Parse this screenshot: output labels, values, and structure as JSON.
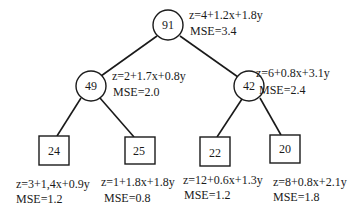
{
  "diagram": {
    "type": "model-tree",
    "nodes": [
      {
        "id": "root",
        "kind": "internal",
        "value": "91",
        "equation": "z=4+1.2x+1.8y",
        "mse": "MSE=3.4",
        "parent": null
      },
      {
        "id": "left",
        "kind": "internal",
        "value": "49",
        "equation": "z=2+1.7x+0.8y",
        "mse": "MSE=2.0",
        "parent": "root"
      },
      {
        "id": "right",
        "kind": "internal",
        "value": "42",
        "equation": "z=6+0.8x+3.1y",
        "mse": "MSE=2.4",
        "parent": "root"
      },
      {
        "id": "leaf1",
        "kind": "leaf",
        "value": "24",
        "equation": "z=3+1,4x+0.9y",
        "mse": "MSE=1.2",
        "parent": "left"
      },
      {
        "id": "leaf2",
        "kind": "leaf",
        "value": "25",
        "equation": "z=1+1.8x+1.8y",
        "mse": "MSE=0.8",
        "parent": "left"
      },
      {
        "id": "leaf3",
        "kind": "leaf",
        "value": "22",
        "equation": "z=12+0.6x+1.3y",
        "mse": "MSE=1.2",
        "parent": "right"
      },
      {
        "id": "leaf4",
        "kind": "leaf",
        "value": "20",
        "equation": "z=8+0.8x+2.1y",
        "mse": "MSE=1.8",
        "parent": "right"
      }
    ]
  }
}
